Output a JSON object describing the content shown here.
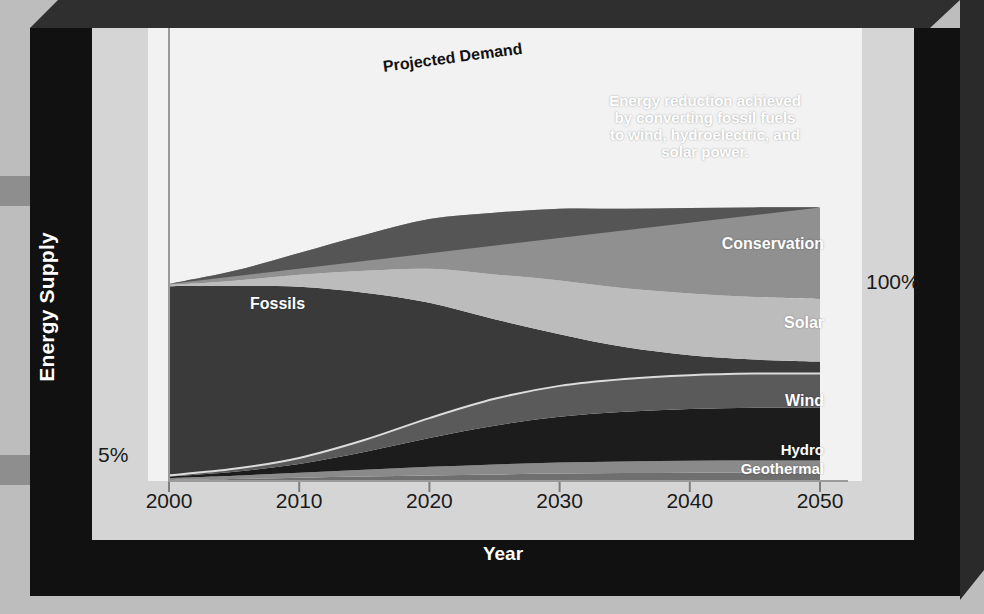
{
  "figure": {
    "y_axis_title": "Energy Supply",
    "x_axis_title": "Year",
    "y_top_label": "100%",
    "y_bottom_label": "5%"
  },
  "annotations": {
    "projected_demand": "Projected Demand",
    "reduction_note": "Energy reduction achieved\nby converting fossil fuels\nto wind, hydroelectric, and\nsolar power.",
    "conservation": "Conservation",
    "fossils": "Fossils",
    "solar": "Solar",
    "wind": "Wind",
    "hydro": "Hydro",
    "geothermal": "Geothermal"
  },
  "colors": {
    "background": "#bdbdbd",
    "frame_black": "#111111",
    "frame_inner": "#d5d5d5",
    "plot_background": "#f2f2f2",
    "geothermal": "#6f6f6f",
    "hydro": "#8a8a8a",
    "wind": "#1c1c1c",
    "solar": "#5a5a5a",
    "fossils": "#3a3a3a",
    "conservation": "#bcbcbc",
    "reduction": "#909090",
    "demand_line": "#555555"
  },
  "chart_data": {
    "type": "area",
    "title": "",
    "xlabel": "Year",
    "ylabel": "Energy Supply",
    "stacked": true,
    "grid": false,
    "legend": "inline-labels",
    "xlim": [
      2000,
      2050
    ],
    "ylim": [
      0,
      130
    ],
    "y_ticks": [
      {
        "value": 5,
        "label": "5%"
      },
      {
        "value": 100,
        "label": "100%"
      }
    ],
    "x_ticks": [
      2000,
      2010,
      2020,
      2030,
      2040,
      2050
    ],
    "x": [
      2000,
      2005,
      2010,
      2015,
      2020,
      2025,
      2030,
      2035,
      2040,
      2045,
      2050
    ],
    "series": [
      {
        "name": "Geothermal",
        "values": [
          0.5,
          1.0,
          1.6,
          2.2,
          2.8,
          3.3,
          3.8,
          4.0,
          4.2,
          4.3,
          4.3
        ]
      },
      {
        "name": "Hydro",
        "values": [
          1.0,
          1.7,
          2.5,
          3.4,
          4.3,
          5.0,
          5.5,
          5.8,
          6.0,
          6.0,
          6.0
        ]
      },
      {
        "name": "Wind",
        "values": [
          0.8,
          2.0,
          4.5,
          9.0,
          14.5,
          19.5,
          23.0,
          25.0,
          26.0,
          26.5,
          26.5
        ]
      },
      {
        "name": "Solar",
        "values": [
          0.6,
          1.4,
          3.0,
          6.0,
          10.0,
          13.5,
          15.5,
          16.5,
          17.0,
          17.2,
          17.2
        ]
      },
      {
        "name": "Fossils",
        "values": [
          95.0,
          92.0,
          86.0,
          74.0,
          58.0,
          40.0,
          26.0,
          16.0,
          10.0,
          7.0,
          6.0
        ]
      },
      {
        "name": "Conservation",
        "values": [
          0.6,
          2.5,
          6.0,
          11.0,
          17.0,
          22.5,
          27.0,
          29.5,
          31.0,
          31.5,
          31.5
        ]
      },
      {
        "name": "Energy reduction",
        "values": [
          0.5,
          5.0,
          11.0,
          18.0,
          25.0,
          31.0,
          36.0,
          40.0,
          43.0,
          45.0,
          46.0
        ]
      }
    ],
    "reference_line": {
      "name": "Projected Demand",
      "x": [
        2000,
        2050
      ],
      "values": [
        99.0,
        137.5
      ]
    }
  },
  "x_tick_labels": [
    "2000",
    "2010",
    "2020",
    "2030",
    "2040",
    "2050"
  ]
}
